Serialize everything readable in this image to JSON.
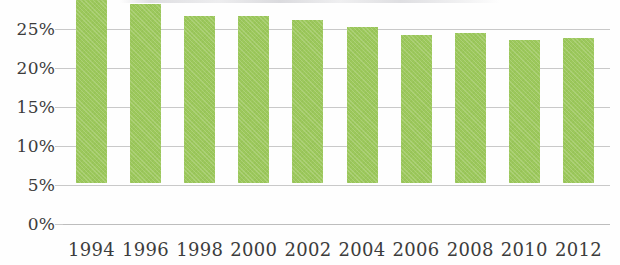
{
  "chart_data": {
    "type": "bar",
    "title": "",
    "xlabel": "",
    "ylabel": "",
    "categories": [
      "1994",
      "1996",
      "1998",
      "2000",
      "2002",
      "2004",
      "2006",
      "2008",
      "2010",
      "2012"
    ],
    "values": [
      23.8,
      23.0,
      21.4,
      21.4,
      20.9,
      20.0,
      19.0,
      19.2,
      18.3,
      18.6
    ],
    "value_suffix": "%",
    "ylim": [
      0,
      25
    ],
    "ytick_step": 5,
    "ytick_labels": [
      "25%",
      "20%",
      "15%",
      "10%",
      "5%",
      "0%"
    ],
    "ytick_values": [
      25,
      20,
      15,
      10,
      5,
      0
    ],
    "grid": true,
    "grid_axis": "y",
    "legend": false,
    "legend_position": "none",
    "series": [
      {
        "name": "",
        "color": "#9cc85c",
        "values": [
          23.8,
          23.0,
          21.4,
          21.4,
          20.9,
          20.0,
          19.0,
          19.2,
          18.3,
          18.6
        ]
      }
    ]
  },
  "style": {
    "bar_color": "#9cc85c",
    "grid_color": "#c9c9c9",
    "axis_text_color": "#3c3c3c",
    "background": "#fefefe"
  }
}
